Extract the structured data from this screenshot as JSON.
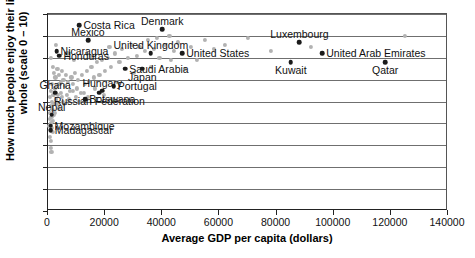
{
  "chart_data": {
    "type": "scatter",
    "title": "",
    "xlabel": "Average GDP per capita (dollars)",
    "ylabel": "How much people enjoy their life as a whole (scale 0 – 10)",
    "xlim": [
      0,
      140000
    ],
    "ylim": [
      0,
      9
    ],
    "xticks": [
      "0",
      "20000",
      "40000",
      "60000",
      "80000",
      "100000",
      "120000",
      "140000"
    ],
    "xtick_values": [
      0,
      20000,
      40000,
      60000,
      80000,
      100000,
      120000,
      140000
    ],
    "yticks": [
      "0",
      "1",
      "2",
      "3",
      "4",
      "5",
      "6",
      "7",
      "8",
      "9"
    ],
    "ytick_values": [
      0,
      1,
      2,
      3,
      4,
      5,
      6,
      7,
      8,
      9
    ],
    "grid": "horizontal",
    "legend": "none",
    "series": [
      {
        "name": "labelled countries",
        "marker": "filled-circle-dark",
        "points": [
          {
            "label": "Costa Rica",
            "x": 11000,
            "y": 8.5,
            "pos": "r"
          },
          {
            "label": "Denmark",
            "x": 40000,
            "y": 8.3,
            "pos": "above"
          },
          {
            "label": "Mexico",
            "x": 14000,
            "y": 7.8,
            "pos": "above"
          },
          {
            "label": "Luxembourg",
            "x": 88000,
            "y": 7.7,
            "pos": "above"
          },
          {
            "label": "Nicaragua",
            "x": 3000,
            "y": 7.3,
            "pos": "r"
          },
          {
            "label": "United Kingdom",
            "x": 36000,
            "y": 7.2,
            "pos": "above"
          },
          {
            "label": "United States",
            "x": 47000,
            "y": 7.2,
            "pos": "r"
          },
          {
            "label": "United Arab Emirates",
            "x": 96000,
            "y": 7.2,
            "pos": "r"
          },
          {
            "label": "Honduras",
            "x": 4000,
            "y": 7.1,
            "pos": "r"
          },
          {
            "label": "Kuwait",
            "x": 85000,
            "y": 6.8,
            "pos": "below"
          },
          {
            "label": "Qatar",
            "x": 118000,
            "y": 6.8,
            "pos": "below"
          },
          {
            "label": "Saudi Arabia",
            "x": 27000,
            "y": 6.5,
            "pos": "r"
          },
          {
            "label": "Japan",
            "x": 33000,
            "y": 6.5,
            "pos": "below"
          },
          {
            "label": "Portugal",
            "x": 23000,
            "y": 5.7,
            "pos": "r"
          },
          {
            "label": "Hungary",
            "x": 19000,
            "y": 5.5,
            "pos": "above"
          },
          {
            "label": "Ghana",
            "x": 2500,
            "y": 5.4,
            "pos": "above"
          },
          {
            "label": "Russian Federation",
            "x": 18000,
            "y": 5.4,
            "pos": "below"
          },
          {
            "label": "Botswana",
            "x": 13000,
            "y": 5.1,
            "pos": "r"
          },
          {
            "label": "Nepal",
            "x": 1300,
            "y": 4.4,
            "pos": "above"
          },
          {
            "label": "Mozambique",
            "x": 900,
            "y": 3.9,
            "pos": "r"
          },
          {
            "label": "Madagascar",
            "x": 1000,
            "y": 3.7,
            "pos": "r"
          }
        ]
      },
      {
        "name": "other countries",
        "marker": "filled-circle-gray",
        "points": [
          {
            "x": 1000,
            "y": 7.0
          },
          {
            "x": 1600,
            "y": 6.6
          },
          {
            "x": 2200,
            "y": 6.3
          },
          {
            "x": 2600,
            "y": 6.1
          },
          {
            "x": 3300,
            "y": 6.5
          },
          {
            "x": 3900,
            "y": 6.2
          },
          {
            "x": 4400,
            "y": 5.9
          },
          {
            "x": 5000,
            "y": 6.4
          },
          {
            "x": 5400,
            "y": 6.0
          },
          {
            "x": 6000,
            "y": 5.7
          },
          {
            "x": 6400,
            "y": 6.2
          },
          {
            "x": 7000,
            "y": 5.9
          },
          {
            "x": 7600,
            "y": 5.5
          },
          {
            "x": 8200,
            "y": 6.1
          },
          {
            "x": 8800,
            "y": 5.8
          },
          {
            "x": 9400,
            "y": 6.3
          },
          {
            "x": 10000,
            "y": 5.6
          },
          {
            "x": 10600,
            "y": 6.0
          },
          {
            "x": 11400,
            "y": 5.4
          },
          {
            "x": 12000,
            "y": 6.2
          },
          {
            "x": 12800,
            "y": 5.8
          },
          {
            "x": 13600,
            "y": 6.4
          },
          {
            "x": 14400,
            "y": 5.9
          },
          {
            "x": 15200,
            "y": 6.6
          },
          {
            "x": 16000,
            "y": 6.1
          },
          {
            "x": 17000,
            "y": 6.8
          },
          {
            "x": 18000,
            "y": 6.2
          },
          {
            "x": 19000,
            "y": 6.9
          },
          {
            "x": 20000,
            "y": 6.4
          },
          {
            "x": 21000,
            "y": 7.0
          },
          {
            "x": 22000,
            "y": 6.6
          },
          {
            "x": 23500,
            "y": 7.2
          },
          {
            "x": 25000,
            "y": 6.8
          },
          {
            "x": 26000,
            "y": 7.4
          },
          {
            "x": 28000,
            "y": 7.0
          },
          {
            "x": 29500,
            "y": 7.6
          },
          {
            "x": 31000,
            "y": 7.1
          },
          {
            "x": 32000,
            "y": 7.5
          },
          {
            "x": 34000,
            "y": 7.3
          },
          {
            "x": 35000,
            "y": 7.8
          },
          {
            "x": 37000,
            "y": 7.4
          },
          {
            "x": 38000,
            "y": 7.9
          },
          {
            "x": 39000,
            "y": 7.0
          },
          {
            "x": 41000,
            "y": 7.6
          },
          {
            "x": 42500,
            "y": 8.0
          },
          {
            "x": 44000,
            "y": 7.3
          },
          {
            "x": 45500,
            "y": 7.7
          },
          {
            "x": 50000,
            "y": 7.5
          },
          {
            "x": 52000,
            "y": 6.9
          },
          {
            "x": 55000,
            "y": 7.8
          },
          {
            "x": 58000,
            "y": 7.4
          },
          {
            "x": 62000,
            "y": 7.6
          },
          {
            "x": 70000,
            "y": 7.9
          },
          {
            "x": 78000,
            "y": 7.3
          },
          {
            "x": 92000,
            "y": 7.5
          },
          {
            "x": 125000,
            "y": 8.0
          },
          {
            "x": 700,
            "y": 5.2
          },
          {
            "x": 900,
            "y": 4.8
          },
          {
            "x": 1100,
            "y": 5.5
          },
          {
            "x": 1300,
            "y": 5.0
          },
          {
            "x": 1500,
            "y": 5.8
          },
          {
            "x": 1700,
            "y": 4.6
          },
          {
            "x": 1900,
            "y": 5.3
          },
          {
            "x": 2100,
            "y": 4.9
          },
          {
            "x": 2400,
            "y": 5.6
          },
          {
            "x": 2800,
            "y": 5.1
          },
          {
            "x": 3100,
            "y": 5.7
          },
          {
            "x": 3500,
            "y": 5.3
          },
          {
            "x": 4000,
            "y": 5.8
          },
          {
            "x": 4600,
            "y": 5.4
          },
          {
            "x": 5200,
            "y": 5.0
          },
          {
            "x": 600,
            "y": 4.2
          },
          {
            "x": 800,
            "y": 4.5
          },
          {
            "x": 1000,
            "y": 4.0
          },
          {
            "x": 1200,
            "y": 4.3
          },
          {
            "x": 1400,
            "y": 3.8
          },
          {
            "x": 1600,
            "y": 4.1
          },
          {
            "x": 1800,
            "y": 3.6
          },
          {
            "x": 2000,
            "y": 4.4
          },
          {
            "x": 800,
            "y": 3.4
          },
          {
            "x": 1100,
            "y": 3.2
          },
          {
            "x": 900,
            "y": 2.9
          },
          {
            "x": 1200,
            "y": 2.7
          },
          {
            "x": 500,
            "y": 3.9
          },
          {
            "x": 700,
            "y": 3.7
          },
          {
            "x": 1500,
            "y": 4.7
          },
          {
            "x": 2300,
            "y": 4.5
          },
          {
            "x": 3000,
            "y": 4.9
          },
          {
            "x": 3800,
            "y": 4.7
          },
          {
            "x": 4800,
            "y": 5.2
          },
          {
            "x": 5600,
            "y": 4.9
          },
          {
            "x": 6600,
            "y": 5.3
          },
          {
            "x": 7400,
            "y": 5.1
          },
          {
            "x": 8600,
            "y": 5.5
          },
          {
            "x": 9800,
            "y": 5.2
          },
          {
            "x": 11000,
            "y": 5.0
          },
          {
            "x": 12500,
            "y": 5.4
          },
          {
            "x": 14000,
            "y": 5.2
          },
          {
            "x": 16500,
            "y": 5.6
          },
          {
            "x": 19500,
            "y": 5.3
          },
          {
            "x": 24000,
            "y": 5.9
          },
          {
            "x": 30000,
            "y": 6.3
          },
          {
            "x": 36000,
            "y": 6.6
          },
          {
            "x": 43000,
            "y": 6.9
          },
          {
            "x": 48000,
            "y": 6.5
          },
          {
            "x": 2700,
            "y": 7.6
          },
          {
            "x": 6800,
            "y": 7.2
          },
          {
            "x": 9000,
            "y": 6.9
          },
          {
            "x": 15000,
            "y": 7.1
          },
          {
            "x": 21500,
            "y": 7.5
          }
        ]
      }
    ]
  },
  "caption": {
    "text": ""
  }
}
